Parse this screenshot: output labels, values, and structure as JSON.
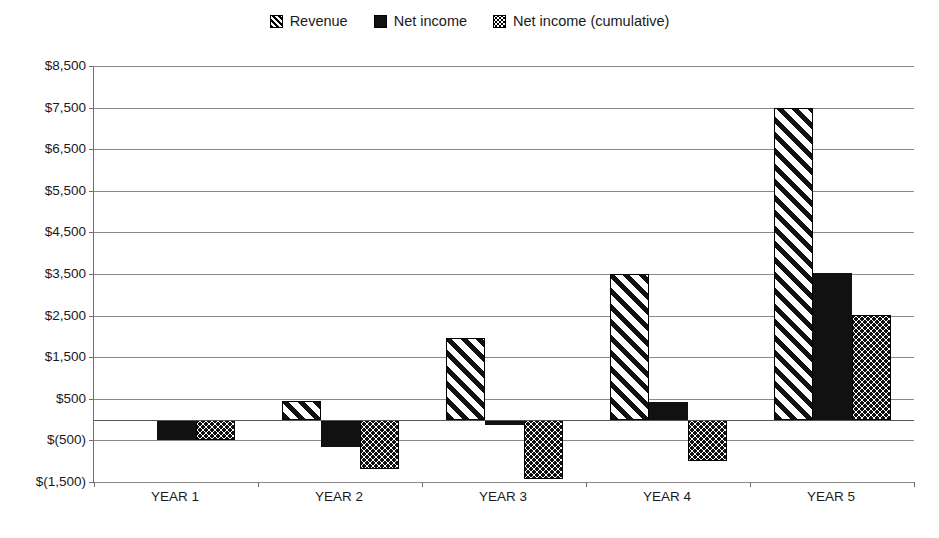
{
  "chart_data": {
    "type": "bar",
    "title": "",
    "subtitle": "",
    "xlabel": "",
    "ylabel": "",
    "categories": [
      "YEAR 1",
      "YEAR 2",
      "YEAR 3",
      "YEAR 4",
      "YEAR 5"
    ],
    "series": [
      {
        "name": "Revenue",
        "pattern": "diagonal-hatch",
        "values": [
          0,
          450,
          1950,
          3500,
          7500
        ]
      },
      {
        "name": "Net income",
        "pattern": "solid-black",
        "values": [
          -500,
          -650,
          -120,
          430,
          3530
        ]
      },
      {
        "name": "Net income (cumulative)",
        "pattern": "dotted",
        "values": [
          -500,
          -1180,
          -1420,
          -1000,
          2520
        ]
      }
    ],
    "ylim": [
      -1500,
      8500
    ],
    "ytick_values": [
      8500,
      7500,
      6500,
      5500,
      4500,
      3500,
      2500,
      1500,
      500,
      -500,
      -1500
    ],
    "ytick_labels": [
      "$8,500",
      "$7,500",
      "$6,500",
      "$5,500",
      "$4,500",
      "$3,500",
      "$2,500",
      "$1,500",
      "$500",
      "$(500)",
      "$(1,500)"
    ],
    "grid": true,
    "legend_position": "top-center",
    "currency_symbol": "$",
    "negative_format": "parentheses",
    "colors": {
      "ink": "#111111",
      "gridline": "#8a8a8a",
      "axis": "#6e6e6e",
      "background": "#ffffff"
    }
  },
  "legend": {
    "items": [
      {
        "label": "Revenue",
        "swatch": "hatch-swatch-icon"
      },
      {
        "label": "Net income",
        "swatch": "solid-swatch-icon"
      },
      {
        "label": "Net income (cumulative)",
        "swatch": "dotted-swatch-icon"
      }
    ]
  }
}
